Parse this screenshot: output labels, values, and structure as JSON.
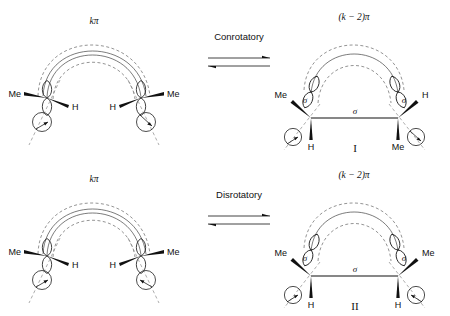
{
  "figure": {
    "background": "#ffffff",
    "ink": "#111111"
  },
  "rows": [
    {
      "id": "conrotatory-row",
      "operation": "Conrotatory",
      "reactant": {
        "system_label": "kπ",
        "left_substituent_outer": "Me",
        "left_substituent_inner": "H",
        "right_substituent_inner": "H",
        "right_substituent_outer": "Me"
      },
      "product": {
        "system_label": "(k − 2)π",
        "sigma_label_left": "σ",
        "sigma_label_center": "σ",
        "sigma_label_right": "σ",
        "left_substituent_upper": "Me",
        "left_substituent_lower": "H",
        "right_substituent_upper": "H",
        "right_substituent_lower": "Me",
        "structure_label": "I"
      }
    },
    {
      "id": "disrotatory-row",
      "operation": "Disrotatory",
      "reactant": {
        "system_label": "kπ",
        "left_substituent_outer": "Me",
        "left_substituent_inner": "H",
        "right_substituent_inner": "H",
        "right_substituent_outer": "Me"
      },
      "product": {
        "system_label": "(k − 2)π",
        "sigma_label_left": "σ",
        "sigma_label_center": "σ",
        "sigma_label_right": "σ",
        "left_substituent_upper": "Me",
        "left_substituent_lower": "H",
        "right_substituent_upper": "Me",
        "right_substituent_lower": "H",
        "structure_label": "II"
      }
    }
  ]
}
